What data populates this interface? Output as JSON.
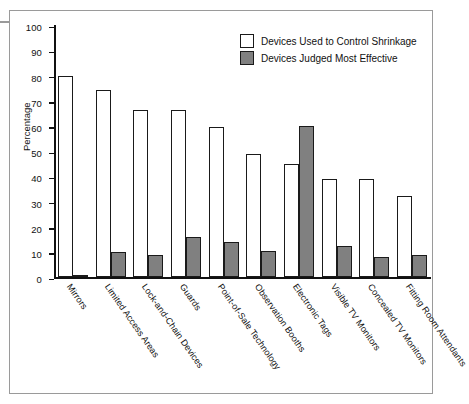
{
  "chart_data": {
    "type": "bar",
    "title": "",
    "xlabel": "",
    "ylabel": "Percentage",
    "ylim": [
      0,
      100
    ],
    "ytick_step": 10,
    "yticks": [
      "100",
      "90",
      "80",
      "70",
      "60",
      "50",
      "40",
      "30",
      "20",
      "10",
      "0"
    ],
    "grid": false,
    "legend_position": "top-right",
    "categories": [
      "Mirrors",
      "Limited Access Areas",
      "Lock-and-Chain Devices",
      "Guards",
      "Point-of-Sale Technology",
      "Observation Booths",
      "Electronic Tags",
      "Visible TV Monitors",
      "Concealed TV Monitors",
      "Fitting Room Attendants"
    ],
    "series": [
      {
        "name": "Devices Used to Control Shrinkage",
        "color": "#ffffff",
        "values": [
          80,
          74.5,
          66.5,
          66.5,
          59.5,
          49,
          45,
          39,
          39,
          32.5
        ]
      },
      {
        "name": "Devices Judged Most Effective",
        "color": "#808080",
        "values": [
          1,
          10,
          9,
          16,
          14,
          10.5,
          60,
          12.5,
          8,
          9
        ]
      }
    ]
  },
  "colors": {
    "frame": "#9a9a9a",
    "axis": "#111111",
    "bar_used_fill": "#ffffff",
    "bar_effective_fill": "#808080",
    "bar_outline": "#1a1a1a",
    "background": "#ffffff"
  }
}
